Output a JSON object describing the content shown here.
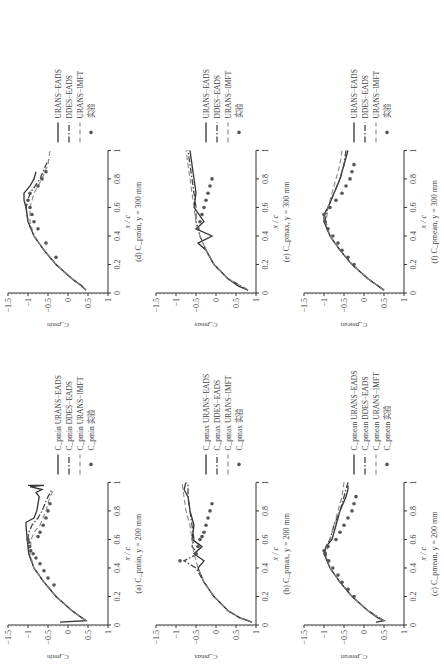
{
  "figure": {
    "orientation": "rotated 90 degrees counter-clockwise",
    "layout": "3 columns x 2 rows"
  },
  "chart_data": [
    {
      "id": "a",
      "type": "line",
      "caption": "(a) C_pmin, y = 200 mm",
      "xlabel": "x / c",
      "ylabel": "C_pmin",
      "xlim": [
        0,
        1
      ],
      "ylim": [
        -1.5,
        1
      ],
      "y_reversed": true,
      "xticks": [
        "0",
        "0.2",
        "0.4",
        "0.6",
        "0.8",
        "1"
      ],
      "yticks": [
        "−1.5",
        "−1",
        "−0.5",
        "0",
        "0.5",
        "1"
      ],
      "legend": [
        "C_pmin URANS−EADS",
        "C_pmin DDES−EADS",
        "C_pmin URANS−IMFT",
        "C_pmin 实验"
      ],
      "series": [
        {
          "name": "URANS−EADS",
          "style": "solid",
          "x": [
            0.02,
            0.03,
            0.05,
            0.1,
            0.2,
            0.3,
            0.4,
            0.5,
            0.6,
            0.7,
            0.72,
            0.75,
            0.8,
            0.85,
            0.9,
            0.93,
            0.95,
            0.97,
            0.98,
            0.98
          ],
          "y": [
            -0.2,
            0.45,
            0.35,
            0.1,
            -0.3,
            -0.6,
            -0.85,
            -0.98,
            -1.02,
            -1.05,
            -1.05,
            -0.85,
            -0.78,
            -0.75,
            -0.72,
            -0.8,
            -0.65,
            -0.95,
            -0.6,
            -1.0
          ]
        },
        {
          "name": "DDES−EADS",
          "style": "dash-dot",
          "x": [
            0.03,
            0.1,
            0.2,
            0.3,
            0.4,
            0.5,
            0.6,
            0.65,
            0.7,
            0.75,
            0.8,
            0.9,
            0.95
          ],
          "y": [
            0.45,
            0.1,
            -0.3,
            -0.6,
            -0.85,
            -0.98,
            -1.0,
            -0.98,
            -0.9,
            -0.75,
            -0.65,
            -0.5,
            -0.4
          ]
        },
        {
          "name": "URANS−IMFT",
          "style": "dashed",
          "x": [
            0.03,
            0.1,
            0.2,
            0.3,
            0.4,
            0.5,
            0.6,
            0.65,
            0.7,
            0.8,
            0.9,
            0.95
          ],
          "y": [
            0.45,
            0.1,
            -0.3,
            -0.6,
            -0.85,
            -0.95,
            -0.92,
            -0.85,
            -0.7,
            -0.55,
            -0.45,
            -0.35
          ]
        },
        {
          "name": "实验",
          "style": "marker",
          "x": [
            0.28,
            0.33,
            0.38,
            0.43,
            0.47,
            0.5,
            0.52,
            0.55,
            0.58,
            0.6,
            0.62,
            0.65,
            0.7,
            0.75,
            0.8,
            0.85
          ],
          "y": [
            -0.35,
            -0.5,
            -0.6,
            -0.7,
            -0.8,
            -0.87,
            -0.93,
            -0.96,
            -0.98,
            -1.0,
            -0.75,
            -0.7,
            -0.62,
            -0.55,
            -0.5,
            -0.45
          ]
        }
      ]
    },
    {
      "id": "b",
      "type": "line",
      "caption": "(b) C_pmax, y = 200 mm",
      "xlabel": "x / c",
      "ylabel": "C_pmax",
      "xlim": [
        0,
        1
      ],
      "ylim": [
        -1.5,
        1
      ],
      "y_reversed": true,
      "xticks": [
        "0",
        "0.2",
        "0.4",
        "0.6",
        "0.8",
        "1"
      ],
      "yticks": [
        "−1.5",
        "−1",
        "−0.5",
        "0",
        "0.5",
        "1"
      ],
      "legend": [
        "C_pmax URANS−EADS",
        "C_pmax DDES−EADS",
        "C_pmax URANS−IMFT",
        "C_pmax 实验"
      ],
      "series": [
        {
          "name": "URANS−EADS",
          "style": "solid",
          "x": [
            0.02,
            0.05,
            0.1,
            0.2,
            0.3,
            0.4,
            0.45,
            0.5,
            0.55,
            0.6,
            0.7,
            0.8,
            0.9,
            0.95,
            1.0
          ],
          "y": [
            0.9,
            0.6,
            0.3,
            -0.05,
            -0.3,
            -0.45,
            -0.3,
            -0.55,
            -0.35,
            -0.6,
            -0.55,
            -0.65,
            -0.7,
            -0.8,
            -0.75
          ]
        },
        {
          "name": "DDES−EADS",
          "style": "dash-dot",
          "x": [
            0.02,
            0.05,
            0.1,
            0.2,
            0.3,
            0.4,
            0.45,
            0.5,
            0.55,
            0.6,
            0.7,
            0.8,
            0.9,
            1.0
          ],
          "y": [
            0.9,
            0.6,
            0.3,
            -0.05,
            -0.3,
            -0.5,
            -0.8,
            -0.45,
            -0.6,
            -0.55,
            -0.6,
            -0.65,
            -0.7,
            -0.7
          ]
        },
        {
          "name": "URANS−IMFT",
          "style": "dashed",
          "x": [
            0.02,
            0.05,
            0.1,
            0.2,
            0.3,
            0.4,
            0.5,
            0.6,
            0.7,
            0.8,
            0.9,
            1.0
          ],
          "y": [
            0.9,
            0.6,
            0.3,
            -0.05,
            -0.3,
            -0.45,
            -0.55,
            -0.6,
            -0.65,
            -0.75,
            -0.8,
            -0.85
          ]
        },
        {
          "name": "实验",
          "style": "marker",
          "x": [
            0.45,
            0.5,
            0.55,
            0.6,
            0.62,
            0.65,
            0.7,
            0.75,
            0.8,
            0.85
          ],
          "y": [
            -0.9,
            -0.5,
            -0.45,
            -0.4,
            -0.35,
            -0.3,
            -0.25,
            -0.2,
            -0.15,
            -0.1
          ]
        }
      ]
    },
    {
      "id": "c",
      "type": "line",
      "caption": "(c) C_pmean, y = 200 mm",
      "xlabel": "x / c",
      "ylabel": "C_pmean",
      "xlim": [
        0,
        1
      ],
      "ylim": [
        -1.5,
        1
      ],
      "y_reversed": true,
      "xticks": [
        "0",
        "0.2",
        "0.4",
        "0.6",
        "0.8",
        "1"
      ],
      "yticks": [
        "−1.5",
        "−1",
        "−0.5",
        "0",
        "0.5",
        "1"
      ],
      "legend": [
        "C_pmean URANS−EADS",
        "C_pmean DDES−EADS",
        "C_pmean URANS−IMFT",
        "C_pmean 实验"
      ],
      "series": [
        {
          "name": "URANS−EADS",
          "style": "solid",
          "x": [
            0.02,
            0.03,
            0.05,
            0.1,
            0.2,
            0.3,
            0.4,
            0.5,
            0.55,
            0.6,
            0.7,
            0.8,
            0.9,
            0.95,
            0.98
          ],
          "y": [
            0.3,
            0.5,
            0.35,
            0.1,
            -0.3,
            -0.6,
            -0.85,
            -1.0,
            -0.95,
            -0.8,
            -0.7,
            -0.6,
            -0.45,
            -0.4,
            -0.4
          ]
        },
        {
          "name": "DDES−EADS",
          "style": "dash-dot",
          "x": [
            0.03,
            0.1,
            0.2,
            0.3,
            0.4,
            0.5,
            0.55,
            0.6,
            0.7,
            0.8,
            0.9,
            1.0
          ],
          "y": [
            0.5,
            0.1,
            -0.3,
            -0.6,
            -0.85,
            -0.98,
            -0.95,
            -0.85,
            -0.75,
            -0.6,
            -0.5,
            -0.4
          ]
        },
        {
          "name": "URANS−IMFT",
          "style": "dashed",
          "x": [
            0.03,
            0.1,
            0.2,
            0.3,
            0.4,
            0.5,
            0.6,
            0.7,
            0.8,
            0.9,
            1.0
          ],
          "y": [
            0.5,
            0.1,
            -0.3,
            -0.6,
            -0.85,
            -0.95,
            -0.85,
            -0.75,
            -0.65,
            -0.55,
            -0.5
          ]
        },
        {
          "name": "实验",
          "style": "marker",
          "x": [
            0.2,
            0.25,
            0.3,
            0.35,
            0.4,
            0.45,
            0.5,
            0.52,
            0.55,
            0.6,
            0.65,
            0.7,
            0.75,
            0.8,
            0.85,
            0.9
          ],
          "y": [
            -0.25,
            -0.4,
            -0.55,
            -0.65,
            -0.78,
            -0.88,
            -0.97,
            -1.0,
            -0.9,
            -0.7,
            -0.6,
            -0.5,
            -0.4,
            -0.3,
            -0.25,
            -0.2
          ]
        }
      ]
    },
    {
      "id": "d",
      "type": "line",
      "caption": "(d) C_pmin, y = 300 mm",
      "xlabel": "x / c",
      "ylabel": "C_pmin",
      "xlim": [
        0,
        1
      ],
      "ylim": [
        -1.5,
        1
      ],
      "y_reversed": true,
      "xticks": [
        "0",
        "0.2",
        "0.4",
        "0.6",
        "0.8",
        "1"
      ],
      "yticks": [
        "−1.5",
        "−1",
        "−0.5",
        "0",
        "0.5",
        "1"
      ],
      "legend": [
        "URANS−EADS",
        "DDES−EADS",
        "URANS−IMFT",
        "实验"
      ],
      "series": [
        {
          "name": "URANS−EADS",
          "style": "solid",
          "x": [
            0.02,
            0.05,
            0.1,
            0.2,
            0.3,
            0.4,
            0.5,
            0.6,
            0.65,
            0.7,
            0.75,
            0.8,
            0.85
          ],
          "y": [
            0.45,
            0.35,
            0.1,
            -0.3,
            -0.6,
            -0.85,
            -1.0,
            -1.05,
            -1.1,
            -1.1,
            -0.95,
            -0.85,
            -0.8
          ]
        },
        {
          "name": "DDES−EADS",
          "style": "dash-dot",
          "x": [
            0.02,
            0.1,
            0.2,
            0.3,
            0.4,
            0.5,
            0.6,
            0.7,
            0.8,
            0.9,
            0.95
          ],
          "y": [
            0.45,
            0.1,
            -0.3,
            -0.6,
            -0.85,
            -1.0,
            -1.05,
            -0.95,
            -0.7,
            -0.55,
            -0.45
          ]
        },
        {
          "name": "URANS−IMFT",
          "style": "dashed",
          "x": [
            0.02,
            0.1,
            0.2,
            0.3,
            0.4,
            0.5,
            0.6,
            0.7,
            0.8,
            0.9,
            1.0
          ],
          "y": [
            0.45,
            0.1,
            -0.3,
            -0.6,
            -0.85,
            -0.95,
            -0.95,
            -0.85,
            -0.65,
            -0.5,
            -0.45
          ]
        },
        {
          "name": "实验",
          "style": "marker",
          "x": [
            0.25,
            0.35,
            0.45,
            0.5,
            0.55,
            0.6,
            0.65,
            0.7,
            0.75,
            0.8,
            0.85
          ],
          "y": [
            -0.3,
            -0.55,
            -0.75,
            -0.85,
            -0.9,
            -0.95,
            -1.0,
            -0.95,
            -0.75,
            -0.65,
            -0.55
          ]
        }
      ]
    },
    {
      "id": "e",
      "type": "line",
      "caption": "(e) C_pmax, y = 300 mm",
      "xlabel": "x / c",
      "ylabel": "C_pmax",
      "xlim": [
        0,
        1
      ],
      "ylim": [
        -1.5,
        1
      ],
      "y_reversed": true,
      "xticks": [
        "0",
        "0.2",
        "0.4",
        "0.6",
        "0.8",
        "1"
      ],
      "yticks": [
        "−1.5",
        "−1",
        "−0.5",
        "0",
        "0.5",
        "1"
      ],
      "legend": [
        "URANS−EADS",
        "DDES−EADS",
        "URANS−IMFT",
        "实验"
      ],
      "series": [
        {
          "name": "URANS−EADS",
          "style": "solid",
          "x": [
            0.02,
            0.05,
            0.1,
            0.2,
            0.3,
            0.35,
            0.4,
            0.45,
            0.5,
            0.6,
            0.7,
            0.8,
            0.9,
            1.0
          ],
          "y": [
            0.8,
            0.55,
            0.3,
            -0.05,
            -0.25,
            -0.45,
            -0.1,
            -0.5,
            -0.3,
            -0.55,
            -0.5,
            -0.55,
            -0.6,
            -0.65
          ]
        },
        {
          "name": "DDES−EADS",
          "style": "dash-dot",
          "x": [
            0.02,
            0.1,
            0.2,
            0.3,
            0.4,
            0.5,
            0.6,
            0.7,
            0.8,
            0.9,
            1.0
          ],
          "y": [
            0.8,
            0.3,
            -0.05,
            -0.25,
            -0.4,
            -0.5,
            -0.5,
            -0.55,
            -0.6,
            -0.65,
            -0.7
          ]
        },
        {
          "name": "URANS−IMFT",
          "style": "dashed",
          "x": [
            0.02,
            0.1,
            0.2,
            0.3,
            0.4,
            0.5,
            0.6,
            0.7,
            0.8,
            0.9,
            1.0
          ],
          "y": [
            0.8,
            0.3,
            -0.05,
            -0.25,
            -0.4,
            -0.5,
            -0.55,
            -0.6,
            -0.65,
            -0.7,
            -0.75
          ]
        },
        {
          "name": "实验",
          "style": "marker",
          "x": [
            0.45,
            0.5,
            0.55,
            0.6,
            0.65,
            0.7,
            0.75,
            0.8
          ],
          "y": [
            -0.45,
            -0.4,
            -0.35,
            -0.3,
            -0.25,
            -0.2,
            -0.15,
            -0.1
          ]
        }
      ]
    },
    {
      "id": "f",
      "type": "line",
      "caption": "(f) C_pmean, y = 300 mm",
      "xlabel": "x / c",
      "ylabel": "C_pmean",
      "xlim": [
        0,
        1
      ],
      "ylim": [
        -1.5,
        1
      ],
      "y_reversed": true,
      "xticks": [
        "0",
        "0.2",
        "0.4",
        "0.6",
        "0.8",
        "1"
      ],
      "yticks": [
        "−1.5",
        "−1",
        "−0.5",
        "0",
        "0.5",
        "1"
      ],
      "legend": [
        "URANS−EADS",
        "DDES−EADS",
        "URANS−IMFT",
        "实验"
      ],
      "series": [
        {
          "name": "URANS−EADS",
          "style": "solid",
          "x": [
            0.02,
            0.05,
            0.1,
            0.2,
            0.3,
            0.4,
            0.5,
            0.55,
            0.6,
            0.7,
            0.8,
            0.9,
            0.95,
            1.0
          ],
          "y": [
            0.5,
            0.35,
            0.1,
            -0.3,
            -0.6,
            -0.85,
            -1.0,
            -1.0,
            -0.9,
            -0.75,
            -0.6,
            -0.5,
            -0.45,
            -0.4
          ]
        },
        {
          "name": "DDES−EADS",
          "style": "dash-dot",
          "x": [
            0.02,
            0.1,
            0.2,
            0.3,
            0.4,
            0.5,
            0.6,
            0.7,
            0.8,
            0.9,
            1.0
          ],
          "y": [
            0.5,
            0.1,
            -0.3,
            -0.6,
            -0.85,
            -0.98,
            -0.9,
            -0.75,
            -0.6,
            -0.5,
            -0.45
          ]
        },
        {
          "name": "URANS−IMFT",
          "style": "dashed",
          "x": [
            0.02,
            0.1,
            0.2,
            0.3,
            0.4,
            0.5,
            0.6,
            0.7,
            0.8,
            0.9,
            1.0
          ],
          "y": [
            0.5,
            0.1,
            -0.3,
            -0.6,
            -0.85,
            -0.95,
            -0.9,
            -0.8,
            -0.7,
            -0.6,
            -0.55
          ]
        },
        {
          "name": "实验",
          "style": "marker",
          "x": [
            0.2,
            0.25,
            0.3,
            0.35,
            0.4,
            0.45,
            0.5,
            0.55,
            0.6,
            0.65,
            0.7,
            0.75,
            0.8,
            0.85,
            0.9
          ],
          "y": [
            -0.25,
            -0.4,
            -0.55,
            -0.65,
            -0.78,
            -0.9,
            -0.97,
            -1.0,
            -0.85,
            -0.7,
            -0.55,
            -0.45,
            -0.35,
            -0.3,
            -0.25
          ]
        }
      ]
    }
  ]
}
